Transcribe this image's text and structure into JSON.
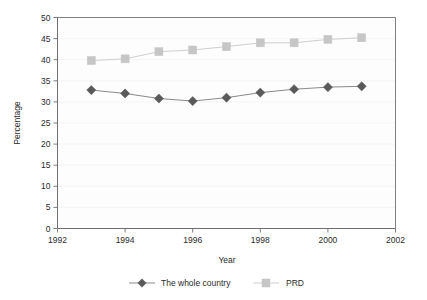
{
  "chart_data": {
    "type": "line",
    "title": "",
    "subtitle": "",
    "xlabel": "Year",
    "ylabel": "Percentage",
    "x": [
      1993,
      1994,
      1995,
      1996,
      1997,
      1998,
      1999,
      2000,
      2001
    ],
    "xlim": [
      1992,
      2002
    ],
    "ylim": [
      0,
      50
    ],
    "xticks": [
      1992,
      1994,
      1996,
      1998,
      2000,
      2002
    ],
    "xtick_labels": [
      "1992",
      "1994",
      "1996",
      "1998",
      "2000",
      "2002"
    ],
    "yticks": [
      0,
      5,
      10,
      15,
      20,
      25,
      30,
      35,
      40,
      45,
      50
    ],
    "ytick_labels": [
      "0",
      "5",
      "10",
      "15",
      "20",
      "25",
      "30",
      "35",
      "40",
      "45",
      "50"
    ],
    "grid": true,
    "legend_position": "bottom",
    "series": [
      {
        "name": "The whole country",
        "marker": "diamond",
        "color": "#5a5a5a",
        "line_color": "#8a8a8a",
        "values": [
          32.8,
          32.0,
          30.8,
          30.2,
          31.0,
          32.2,
          33.0,
          33.5,
          33.7
        ]
      },
      {
        "name": "PRD",
        "marker": "square",
        "color": "#c6c6c6",
        "line_color": "#cfcfcf",
        "values": [
          39.8,
          40.2,
          41.9,
          42.3,
          43.1,
          44.0,
          44.0,
          44.8,
          45.2
        ]
      }
    ]
  },
  "legend": {
    "items": [
      {
        "label": "The whole country"
      },
      {
        "label": "PRD"
      }
    ]
  }
}
